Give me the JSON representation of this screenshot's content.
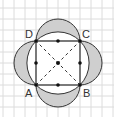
{
  "diagram": {
    "grid": {
      "spacing": 11,
      "x_start": 3,
      "y_start": 8,
      "color": "#dcdcdc"
    },
    "colors": {
      "stroke": "#333333",
      "lune_fill": "#cfcfcf",
      "circle_fill": "#ffffff"
    },
    "square": {
      "vertices": [
        {
          "name": "A",
          "x": 36,
          "y": 85
        },
        {
          "name": "B",
          "x": 80,
          "y": 85
        },
        {
          "name": "C",
          "x": 80,
          "y": 41
        },
        {
          "name": "D",
          "x": 36,
          "y": 41
        }
      ],
      "center": {
        "x": 58,
        "y": 63
      }
    },
    "labels": [
      {
        "text": "A",
        "x": 25,
        "y": 97
      },
      {
        "text": "B",
        "x": 83,
        "y": 97
      },
      {
        "text": "C",
        "x": 82,
        "y": 38
      },
      {
        "text": "D",
        "x": 25,
        "y": 38
      }
    ],
    "midpoints": [
      {
        "x": 58,
        "y": 41
      },
      {
        "x": 80,
        "y": 63
      },
      {
        "x": 58,
        "y": 85
      },
      {
        "x": 36,
        "y": 63
      }
    ]
  }
}
